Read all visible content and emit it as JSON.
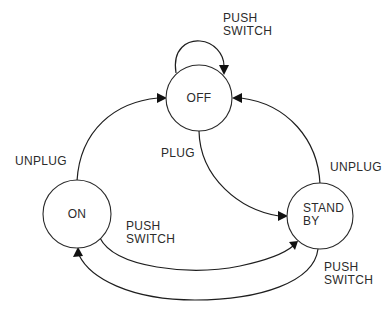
{
  "diagram": {
    "type": "state-machine",
    "states": [
      {
        "id": "off",
        "lines": [
          "OFF"
        ]
      },
      {
        "id": "on",
        "lines": [
          "ON"
        ]
      },
      {
        "id": "standby",
        "lines": [
          "STAND",
          "BY"
        ]
      }
    ],
    "transitions": [
      {
        "id": "off-self",
        "from": "off",
        "to": "off",
        "lines": [
          "PUSH",
          "SWITCH"
        ]
      },
      {
        "id": "on-to-off",
        "from": "on",
        "to": "off",
        "lines": [
          "UNPLUG"
        ]
      },
      {
        "id": "standby-to-off",
        "from": "standby",
        "to": "off",
        "lines": [
          "UNPLUG"
        ]
      },
      {
        "id": "off-to-standby",
        "from": "off",
        "to": "standby",
        "lines": [
          "PLUG"
        ]
      },
      {
        "id": "on-to-standby",
        "from": "on",
        "to": "standby",
        "lines": [
          "PUSH",
          "SWITCH"
        ]
      },
      {
        "id": "standby-to-on",
        "from": "standby",
        "to": "on",
        "lines": [
          "PUSH",
          "SWITCH"
        ]
      }
    ]
  }
}
